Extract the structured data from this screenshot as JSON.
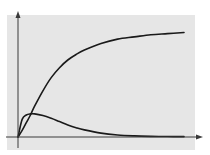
{
  "chart_data": {
    "type": "line",
    "title": "",
    "xlabel": "",
    "ylabel": "",
    "xlim": [
      0,
      10
    ],
    "ylim": [
      0,
      1
    ],
    "grid": false,
    "legend": null,
    "background_color": "#e6e6e6",
    "line_color": "#1a1a1a",
    "axis_color": "#3a3a3a",
    "x": [
      0,
      0.25,
      0.5,
      0.75,
      1.0,
      1.5,
      2.0,
      2.5,
      3.0,
      3.5,
      4.0,
      5.0,
      6.0,
      7.0,
      8.0,
      9.0,
      10.0
    ],
    "series": [
      {
        "name": "saturating-curve",
        "values": [
          0.0,
          0.06,
          0.13,
          0.2,
          0.28,
          0.42,
          0.54,
          0.63,
          0.7,
          0.75,
          0.79,
          0.85,
          0.89,
          0.91,
          0.93,
          0.94,
          0.95
        ]
      },
      {
        "name": "hump-curve",
        "values": [
          0.0,
          0.16,
          0.2,
          0.21,
          0.21,
          0.195,
          0.17,
          0.14,
          0.11,
          0.085,
          0.065,
          0.035,
          0.018,
          0.01,
          0.006,
          0.004,
          0.003
        ]
      }
    ],
    "annotations": []
  }
}
